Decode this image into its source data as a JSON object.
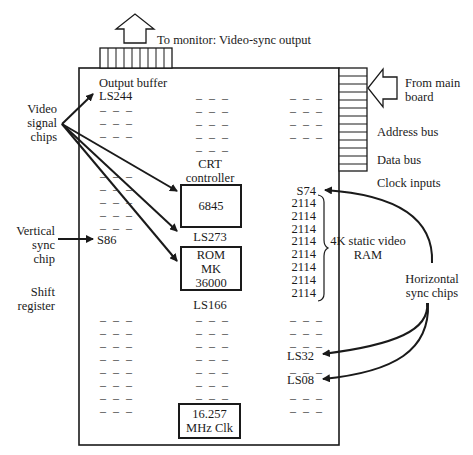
{
  "external": {
    "monitor_output": "To monitor: Video-sync output",
    "from_main_board": [
      "From main",
      "board"
    ],
    "address_bus": "Address bus",
    "data_bus": "Data bus",
    "clock_inputs": "Clock inputs"
  },
  "callouts": {
    "video_signal_chips": [
      "Video",
      "signal",
      "chips"
    ],
    "vertical_sync_chip": [
      "Vertical",
      "sync",
      "chip"
    ],
    "shift_register": [
      "Shift",
      "register"
    ],
    "horizontal_sync_chips": [
      "Horizontal",
      "sync chips"
    ]
  },
  "board": {
    "output_buffer_label": "Output buffer",
    "ls244": "LS244",
    "crt_controller_label": [
      "CRT",
      "controller"
    ],
    "chip_6845": "6845",
    "ls273": "LS273",
    "rom": [
      "ROM",
      "MK",
      "36000"
    ],
    "ls166": "LS166",
    "s86": "S86",
    "clock": [
      "16.257",
      "MHz Clk"
    ],
    "s74": "S74",
    "ram_chips": [
      "2114",
      "2114",
      "2114",
      "2114",
      "2114",
      "2114",
      "2114",
      "2114"
    ],
    "ram_label": [
      "4K static video",
      "RAM"
    ],
    "ls32": "LS32",
    "ls08": "LS08",
    "unlabeled_chip": "– – –"
  }
}
